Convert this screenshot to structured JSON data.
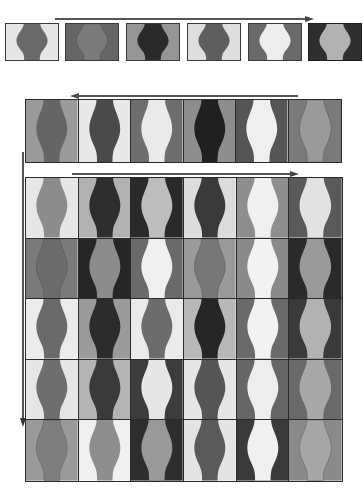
{
  "figure": {
    "shape": "vase-silhouette",
    "palette": {
      "white": "#ececec",
      "light": "#b8b8b8",
      "mid": "#8c8c8c",
      "dark": "#5f5f5f",
      "black": "#262626"
    }
  },
  "row1": {
    "arrow": "right",
    "tiles": [
      {
        "bg": "#e6e6e6",
        "fg": "#6a6a6a"
      },
      {
        "bg": "#666666",
        "fg": "#7a7a7a"
      },
      {
        "bg": "#959595",
        "fg": "#2a2a2a"
      },
      {
        "bg": "#dedede",
        "fg": "#5e5e5e"
      },
      {
        "bg": "#6a6a6a",
        "fg": "#ededed"
      },
      {
        "bg": "#2f2f2f",
        "fg": "#b2b2b2"
      }
    ]
  },
  "row2": {
    "arrow": "left",
    "tiles": [
      {
        "bg": "#9a9a9a",
        "fg": "#656565"
      },
      {
        "bg": "#e8e8e8",
        "fg": "#4a4a4a"
      },
      {
        "bg": "#6e6e6e",
        "fg": "#eaeaea"
      },
      {
        "bg": "#8e8e8e",
        "fg": "#202020"
      },
      {
        "bg": "#555555",
        "fg": "#efefef"
      },
      {
        "bg": "#7a7a7a",
        "fg": "#9a9a9a"
      }
    ]
  },
  "grid": {
    "arrow_top": "right",
    "arrow_side": "down",
    "rows": [
      [
        {
          "bg": "#e6e6e6",
          "fg": "#8c8c8c"
        },
        {
          "bg": "#b2b2b2",
          "fg": "#2e2e2e"
        },
        {
          "bg": "#2a2a2a",
          "fg": "#bdbdbd"
        },
        {
          "bg": "#dcdcdc",
          "fg": "#3a3a3a"
        },
        {
          "bg": "#8e8e8e",
          "fg": "#f0f0f0"
        },
        {
          "bg": "#5a5a5a",
          "fg": "#e2e2e2"
        }
      ],
      [
        {
          "bg": "#7a7a7a",
          "fg": "#6c6c6c"
        },
        {
          "bg": "#262626",
          "fg": "#8c8c8c"
        },
        {
          "bg": "#6a6a6a",
          "fg": "#efefef"
        },
        {
          "bg": "#9a9a9a",
          "fg": "#777777"
        },
        {
          "bg": "#8a8a8a",
          "fg": "#f2f2f2"
        },
        {
          "bg": "#2a2a2a",
          "fg": "#9a9a9a"
        }
      ],
      [
        {
          "bg": "#ebebeb",
          "fg": "#6a6a6a"
        },
        {
          "bg": "#9a9a9a",
          "fg": "#2c2c2c"
        },
        {
          "bg": "#eaeaea",
          "fg": "#6c6c6c"
        },
        {
          "bg": "#b8b8b8",
          "fg": "#262626"
        },
        {
          "bg": "#6a6a6a",
          "fg": "#f2f2f2"
        },
        {
          "bg": "#3a3a3a",
          "fg": "#b2b2b2"
        }
      ],
      [
        {
          "bg": "#e6e6e6",
          "fg": "#6e6e6e"
        },
        {
          "bg": "#b4b4b4",
          "fg": "#3a3a3a"
        },
        {
          "bg": "#3c3c3c",
          "fg": "#e6e6e6"
        },
        {
          "bg": "#e6e6e6",
          "fg": "#555555"
        },
        {
          "bg": "#666666",
          "fg": "#ededed"
        },
        {
          "bg": "#6a6a6a",
          "fg": "#a8a8a8"
        }
      ],
      [
        {
          "bg": "#9a9a9a",
          "fg": "#7e7e7e"
        },
        {
          "bg": "#f0f0f0",
          "fg": "#8e8e8e"
        },
        {
          "bg": "#2e2e2e",
          "fg": "#999999"
        },
        {
          "bg": "#e4e4e4",
          "fg": "#5a5a5a"
        },
        {
          "bg": "#3a3a3a",
          "fg": "#f0f0f0"
        },
        {
          "bg": "#8a8a8a",
          "fg": "#a6a6a6"
        }
      ]
    ]
  }
}
